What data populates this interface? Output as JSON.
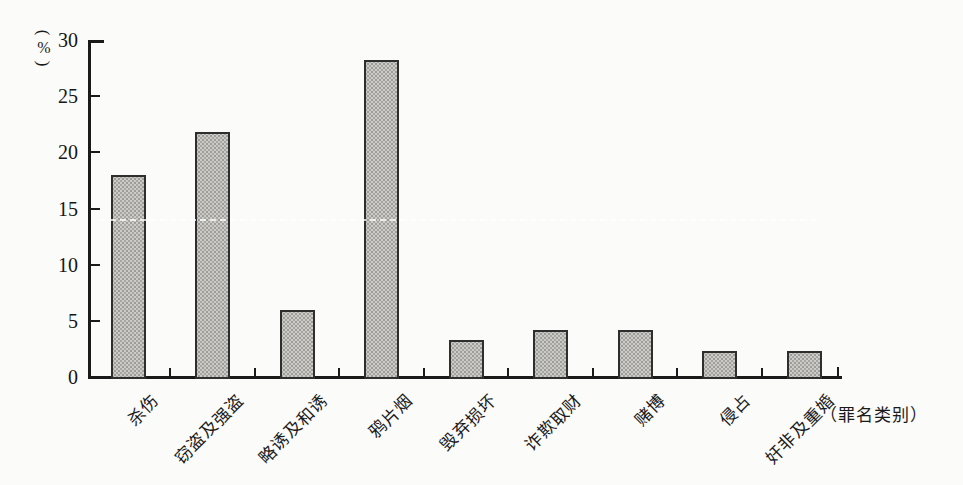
{
  "chart_data": {
    "type": "bar",
    "title": "",
    "categories": [
      "杀伤",
      "窃盗及强盗",
      "略诱及和诱",
      "鸦片烟",
      "毁弃损坏",
      "诈欺取财",
      "赌博",
      "侵占",
      "奸非及重婚"
    ],
    "values": [
      18.0,
      21.8,
      6.0,
      28.2,
      3.3,
      4.2,
      4.2,
      2.3,
      2.3
    ],
    "xlabel": "（罪名类别）",
    "ylabel": "(%)",
    "ylim": [
      0,
      30
    ],
    "yticks": [
      0,
      5,
      10,
      15,
      20,
      25,
      30
    ],
    "grid": false,
    "legend_position": "none",
    "bar_fill_color": "#cccbc8",
    "bar_border_color": "#2e2e2c",
    "axis_color": "#1a1a1a"
  },
  "axis_unit": {
    "open": "(",
    "symbol": "%",
    "close": ")"
  }
}
